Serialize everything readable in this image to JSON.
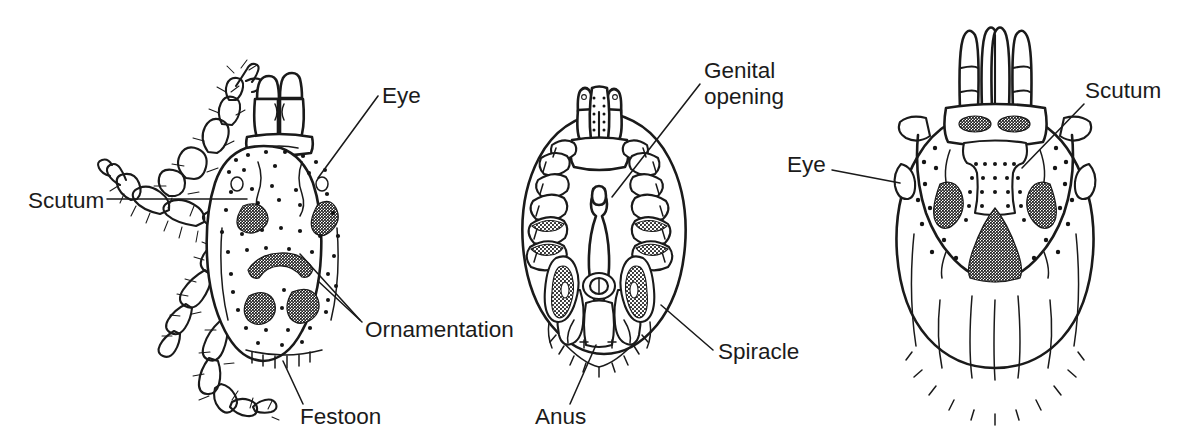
{
  "figure": {
    "background_color": "#ffffff",
    "ink_color": "#1a1a1a",
    "width": 1179,
    "height": 445
  },
  "panels": [
    {
      "id": "panel-left",
      "name": "male-dorsal-with-legs",
      "view": "dorsal",
      "description": "Ornate tick, dorsal view with legs and palps visible"
    },
    {
      "id": "panel-middle",
      "name": "female-ventral",
      "view": "ventral",
      "description": "Tick ventral view showing coxae, genital opening, anus and spiracles"
    },
    {
      "id": "panel-right",
      "name": "female-dorsal",
      "view": "dorsal",
      "description": "Tick dorsal view showing scutum, eyes and ornamentation"
    }
  ],
  "labels": [
    {
      "id": "label-eye-left",
      "text": "Eye",
      "panel": "panel-left",
      "x": 382,
      "y": 103,
      "anchor": "start",
      "leader": "M 378 96 L 318 178"
    },
    {
      "id": "label-scutum-left",
      "text": "Scutum",
      "panel": "panel-left",
      "x": 28,
      "y": 208,
      "anchor": "start",
      "leader": "M 107 199 L 247 199"
    },
    {
      "id": "label-ornamentation",
      "text": "Ornamentation",
      "panel": "panel-left",
      "x": 365,
      "y": 337,
      "anchor": "start",
      "leader": "M 360 320 L 300 254"
    },
    {
      "id": "label-ornamentation-2",
      "text": "",
      "panel": "panel-left",
      "x": 365,
      "y": 337,
      "anchor": "start",
      "leader": "M 362 322 L 318 281"
    },
    {
      "id": "label-festoon",
      "text": "Festoon",
      "panel": "panel-left",
      "x": 300,
      "y": 424,
      "anchor": "start",
      "leader": "M 303 404 L 283 361"
    },
    {
      "id": "label-genital-opening-1",
      "text": "Genital",
      "panel": "panel-middle",
      "x": 704,
      "y": 78,
      "anchor": "start",
      "leader": "M 700 84 L 612 197"
    },
    {
      "id": "label-genital-opening-2",
      "text": "opening",
      "panel": "panel-middle",
      "x": 704,
      "y": 104,
      "anchor": "start",
      "leader": ""
    },
    {
      "id": "label-spiracle",
      "text": "Spiracle",
      "panel": "panel-middle",
      "x": 718,
      "y": 359,
      "anchor": "start",
      "leader": "M 713 350 L 661 305"
    },
    {
      "id": "label-anus",
      "text": "Anus",
      "panel": "panel-middle",
      "x": 535,
      "y": 424,
      "anchor": "start",
      "leader": "M 570 404 L 596 345"
    },
    {
      "id": "label-eye-right",
      "text": "Eye",
      "panel": "panel-right",
      "x": 787,
      "y": 172,
      "anchor": "start",
      "leader": "M 832 170 L 900 183"
    },
    {
      "id": "label-scutum-right",
      "text": "Scutum",
      "panel": "panel-right",
      "x": 1085,
      "y": 98,
      "anchor": "start",
      "leader": "M 1084 104 L 1022 168"
    }
  ]
}
